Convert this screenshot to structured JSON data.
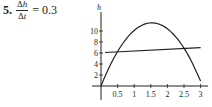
{
  "problem": {
    "number": "5.",
    "numerator_delta": "Δ",
    "numerator_var": "h",
    "denominator_delta": "Δ",
    "denominator_var": "t",
    "equals": "= 0.3"
  },
  "colors": {
    "ink": "#231f20",
    "background": "#ffffff"
  },
  "chart_data": {
    "type": "line",
    "title": "",
    "xlabel": "",
    "ylabel": "h",
    "xlim": [
      0,
      3
    ],
    "ylim": [
      0,
      12
    ],
    "x_ticks": [
      0.5,
      1,
      1.5,
      2,
      2.5,
      3
    ],
    "x_tick_labels": [
      "0.5",
      "1",
      "1.5",
      "2",
      "2.5",
      "3"
    ],
    "y_ticks": [
      2,
      4,
      6,
      8,
      10
    ],
    "y_tick_labels": [
      "2",
      "4",
      "6",
      "8",
      "10"
    ],
    "grid": false,
    "legend": null,
    "series": [
      {
        "name": "h(t) = 15t − 4.9t²",
        "kind": "curve",
        "x": [
          0,
          0.25,
          0.5,
          0.75,
          1,
          1.25,
          1.5,
          1.75,
          2,
          2.25,
          2.5,
          2.75,
          3
        ],
        "values": [
          0,
          3.44,
          6.28,
          8.49,
          10.1,
          11.09,
          11.48,
          11.24,
          10.4,
          8.94,
          6.88,
          4.19,
          0.9
        ]
      },
      {
        "name": "secant line (slope 0.3)",
        "kind": "line",
        "x": [
          0.12,
          3
        ],
        "values": [
          6.09,
          6.96
        ]
      }
    ],
    "annotations": [
      "Δh/Δt = 0.3"
    ]
  }
}
